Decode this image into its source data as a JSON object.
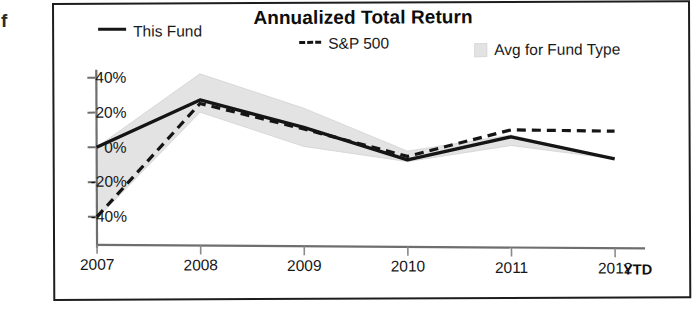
{
  "artifact": {
    "glyph": "f"
  },
  "chart_title": "Annualized Total Return",
  "legend": {
    "this_fund": {
      "label": "This Fund",
      "marker": "solid-line-swatch",
      "color": "#151515"
    },
    "sp500": {
      "label": "S&P 500",
      "marker": "dashed-line-swatch",
      "color": "#151515"
    },
    "avg_fund_type": {
      "label": "Avg for Fund Type",
      "marker": "area-swatch",
      "color": "#e3e3e3"
    }
  },
  "axes": {
    "y_ticks": [
      "40%",
      "20%",
      "0%",
      "-20%",
      "-40%"
    ],
    "x_ticks": [
      "2007",
      "2008",
      "2009",
      "2010",
      "2011",
      "2012"
    ],
    "x_suffix": "YTD"
  },
  "chart_data": {
    "type": "line",
    "title": "Annualized Total Return",
    "xlabel": "",
    "ylabel": "",
    "categories": [
      "2007",
      "2008",
      "2009",
      "2010",
      "2011",
      "2012"
    ],
    "x_axis_note": "2012 YTD",
    "ylim": [
      -48,
      48
    ],
    "yticks": [
      40,
      20,
      0,
      -20,
      -40
    ],
    "ytick_labels": [
      "40%",
      "20%",
      "0%",
      "-20%",
      "-40%"
    ],
    "grid": false,
    "legend_position": "top",
    "series": [
      {
        "name": "This Fund",
        "style": "solid",
        "color": "#151515",
        "values": [
          0,
          27,
          11,
          -8,
          5,
          -8
        ]
      },
      {
        "name": "S&P 500",
        "style": "dashed",
        "color": "#151515",
        "values": [
          -40,
          25,
          10,
          -6,
          9,
          8
        ]
      },
      {
        "name": "Avg for Fund Type",
        "style": "band",
        "color": "#e3e3e3",
        "band_upper": [
          0,
          42,
          22,
          -3,
          6,
          -8
        ],
        "band_lower": [
          -41,
          20,
          0,
          -9,
          0,
          -8
        ]
      }
    ]
  }
}
